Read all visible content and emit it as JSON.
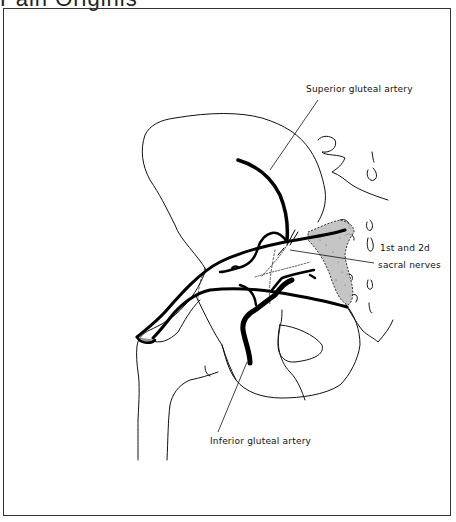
{
  "header": {
    "cropped_title": "Pain Originis"
  },
  "figure": {
    "type": "anatomical-line-drawing",
    "labels": {
      "superior": "Superior gluteal artery",
      "sacral_line1": "1st and 2d",
      "sacral_line2": "sacral nerves",
      "inferior": "Inferior gluteal artery"
    }
  }
}
